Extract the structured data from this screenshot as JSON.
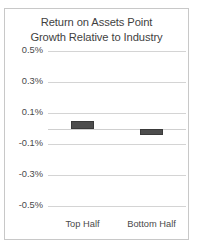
{
  "chart_data": {
    "type": "bar",
    "title": "Return on Assets Point Growth Relative to Industry",
    "title_lines": [
      "Return on Assets Point",
      "Growth Relative to Industry"
    ],
    "xlabel": "",
    "ylabel": "",
    "categories": [
      "Top Half",
      "Bottom Half"
    ],
    "values": [
      0.05,
      -0.04
    ],
    "value_unit": "%",
    "ylim": [
      -0.5,
      0.5
    ],
    "yticks": [
      0.5,
      0.3,
      0.1,
      -0.1,
      -0.3,
      -0.5
    ],
    "ytick_labels": [
      "0.5%",
      "0.3%",
      "0.1%",
      "-0.1%",
      "-0.3%",
      "-0.5%"
    ],
    "gridlines": [
      0.5,
      0.3,
      0.1,
      0.0,
      -0.1,
      -0.3,
      -0.5
    ],
    "zero_line": 0.0,
    "grid": true,
    "legend": false,
    "legend_position": "none",
    "series": [
      {
        "name": "Return on Assets Point Growth Relative to Industry",
        "values": [
          0.05,
          -0.04
        ],
        "color": "#4d4d4d"
      }
    ],
    "colors": {
      "bar_fill": "#4d4d4d",
      "bar_border": "#3a3a3a",
      "gridline": "#d4d4d4",
      "text": "#4a4a4a",
      "title_text": "#3f3f3f",
      "frame_border": "#c8c8c8",
      "background": "#ffffff"
    }
  }
}
